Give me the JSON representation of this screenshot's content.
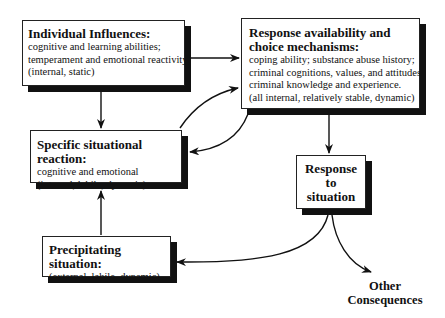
{
  "diagram": {
    "nodes": {
      "individual": {
        "title": "Individual Influences:",
        "lines": [
          "cognitive and learning abilities;",
          "temperament and emotional reactivity.",
          "(internal, static)"
        ]
      },
      "response_availability": {
        "title_line1": "Response availability and",
        "title_line2": "choice mechanisms:",
        "lines": [
          "coping ability; substance abuse history;",
          "criminal cognitions, values, and attitudes;",
          "criminal knowledge and experience.",
          "(all internal, relatively stable, dynamic)"
        ]
      },
      "specific_reaction": {
        "title": "Specific situational reaction:",
        "lines": [
          "cognitive and emotional",
          "(internal, labile, dynamic)"
        ]
      },
      "precipitating": {
        "title": "Precipitating situation:",
        "lines": [
          "(external, labile, dynamic)"
        ]
      },
      "response_to_situation": {
        "lines": [
          "Response",
          "to",
          "situation"
        ]
      },
      "other_consequences": {
        "lines": [
          "Other",
          "Consequences"
        ]
      }
    },
    "edges": [
      {
        "from": "Individual Influences",
        "to": "Response availability and choice mechanisms"
      },
      {
        "from": "Individual Influences",
        "to": "Specific situational reaction"
      },
      {
        "from": "Specific situational reaction",
        "to": "Response availability and choice mechanisms"
      },
      {
        "from": "Response availability and choice mechanisms",
        "to": "Specific situational reaction"
      },
      {
        "from": "Response availability and choice mechanisms",
        "to": "Response to situation"
      },
      {
        "from": "Precipitating situation",
        "to": "Specific situational reaction"
      },
      {
        "from": "Response to situation",
        "to": "Precipitating situation"
      },
      {
        "from": "Response to situation",
        "to": "Other Consequences"
      }
    ],
    "colors": {
      "line": "#111111",
      "box_fill": "#ffffff",
      "shadow": "#111111"
    }
  }
}
